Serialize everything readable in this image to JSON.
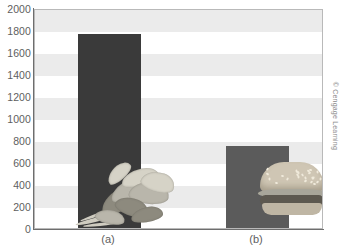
{
  "figure": {
    "credit": "© Cengage Learning"
  },
  "chart_data": {
    "type": "bar",
    "title": "",
    "xlabel": "",
    "ylabel": "",
    "categories": [
      "(a)",
      "(b)"
    ],
    "values": [
      1760,
      745
    ],
    "ylim": [
      0,
      2000
    ],
    "yticks": [
      2000,
      1800,
      1600,
      1400,
      1200,
      1000,
      800,
      600,
      400,
      200,
      0
    ],
    "ytick_labels": [
      "2000",
      "1800",
      "1600",
      "1400",
      "1200",
      "1000",
      "800",
      "600",
      "400",
      "200",
      "0"
    ],
    "grid": false,
    "banded_background": true,
    "band_ranges": [
      [
        1800,
        2000
      ],
      [
        1400,
        1600
      ],
      [
        1000,
        1200
      ],
      [
        600,
        800
      ],
      [
        200,
        400
      ]
    ],
    "legend": "none",
    "series": [
      {
        "name": "",
        "values": [
          1760,
          745
        ],
        "colors": [
          "#3a3a3a",
          "#5b5b5b"
        ]
      }
    ],
    "annotations": [
      {
        "category": "(a)",
        "image": "leafy-greens-photo"
      },
      {
        "category": "(b)",
        "image": "hamburger-photo"
      }
    ]
  },
  "colors": {
    "bar_a": "#3a3a3a",
    "bar_b": "#5b5b5b",
    "band": "#ebebeb",
    "axis": "#6e6e6e",
    "frame": "#b9b9b9",
    "text": "#5e5e5e"
  }
}
